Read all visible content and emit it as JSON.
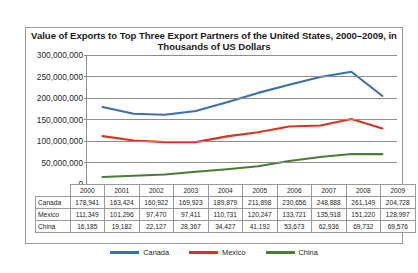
{
  "chart_data": {
    "type": "line",
    "title": "Value of Exports to Top Three Export Partners of the United States, 2000–2009, in Thousands of US Dollars",
    "xlabel": "",
    "ylabel": "",
    "categories": [
      "2000",
      "2001",
      "2002",
      "2003",
      "2004",
      "2005",
      "2006",
      "2007",
      "2008",
      "2009"
    ],
    "series": [
      {
        "name": "Canada",
        "color": "#3a6fb0",
        "values": [
          178941,
          163424,
          160922,
          169923,
          189879,
          211898,
          230656,
          248888,
          261149,
          204728
        ],
        "values_formatted": [
          "178,941",
          "163,424",
          "160,922",
          "169,923",
          "189,879",
          "211,898",
          "230,656",
          "248,888",
          "261,149",
          "204,728"
        ]
      },
      {
        "name": "Mexico",
        "color": "#d8341f",
        "values": [
          111349,
          101296,
          97470,
          97411,
          110731,
          120247,
          133721,
          135918,
          151220,
          128997
        ],
        "values_formatted": [
          "111,349",
          "101,296",
          "97,470",
          "97,411",
          "110,731",
          "120,247",
          "133,721",
          "135,918",
          "151,220",
          "128,997"
        ]
      },
      {
        "name": "China",
        "color": "#4a7c36",
        "values": [
          16185,
          19182,
          22127,
          28367,
          34427,
          41192,
          53673,
          62936,
          69732,
          69576
        ],
        "values_formatted": [
          "16,185",
          "19,182",
          "22,127",
          "28,367",
          "34,427",
          "41,192",
          "53,673",
          "62,936",
          "69,732",
          "69,576"
        ]
      }
    ],
    "ylim": [
      0,
      300000000
    ],
    "y_ticks": [
      0,
      50000000,
      100000000,
      150000000,
      200000000,
      250000000,
      300000000
    ],
    "y_tick_labels": [
      "0",
      "50,000,000",
      "100,000,000",
      "150,000,000",
      "200,000,000",
      "250,000,000",
      "300,000,000"
    ],
    "value_scale_note": "plotted values are thousands of US dollars scaled against an axis labelled in units",
    "grid": true,
    "legend_position": "bottom"
  },
  "table": {
    "corner_label": "",
    "column_headers": [
      "2000",
      "2001",
      "2002",
      "2003",
      "2004",
      "2005",
      "2006",
      "2007",
      "2008",
      "2009"
    ],
    "rows": [
      {
        "label": "Canada",
        "cells": [
          "178,941",
          "163,424",
          "160,922",
          "169,923",
          "189,879",
          "211,898",
          "230,656",
          "248,888",
          "261,149",
          "204,728"
        ]
      },
      {
        "label": "Mexico",
        "cells": [
          "111,349",
          "101,296",
          "97,470",
          "97,411",
          "110,731",
          "120,247",
          "133,721",
          "135,918",
          "151,220",
          "128,997"
        ]
      },
      {
        "label": "China",
        "cells": [
          "16,185",
          "19,182",
          "22,127",
          "28,367",
          "34,427",
          "41,192",
          "53,673",
          "62,936",
          "69,732",
          "69,576"
        ]
      }
    ]
  },
  "legend": {
    "items": [
      {
        "label": "Canada",
        "color": "#3a6fb0"
      },
      {
        "label": "Mexico",
        "color": "#d8341f"
      },
      {
        "label": "China",
        "color": "#4a7c36"
      }
    ]
  }
}
